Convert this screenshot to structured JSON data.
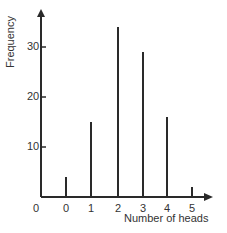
{
  "chart_data": {
    "type": "bar",
    "style": "stick",
    "title": "",
    "xlabel": "Number of heads",
    "ylabel": "Frequency",
    "origin_label": "0",
    "categories": [
      "0",
      "1",
      "2",
      "3",
      "4",
      "5"
    ],
    "values": [
      4,
      15,
      34,
      29,
      16,
      2
    ],
    "yticks": [
      10,
      20,
      30
    ],
    "ytick_labels": [
      "10",
      "20",
      "30"
    ],
    "ylim": [
      0,
      38
    ],
    "grid": false,
    "legend": null,
    "colors": {
      "bar": "#2a2a2a",
      "axis": "#2a2a2a",
      "text": "#333333"
    }
  }
}
